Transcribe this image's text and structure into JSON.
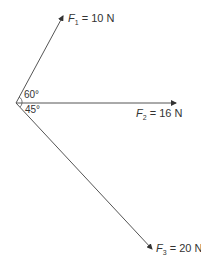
{
  "diagram": {
    "type": "force-vectors",
    "forces": [
      {
        "name": "F",
        "sub": "1",
        "value": "= 10 N"
      },
      {
        "name": "F",
        "sub": "2",
        "value": "= 16 N"
      },
      {
        "name": "F",
        "sub": "3",
        "value": "= 20 N"
      }
    ],
    "angles": [
      "60°",
      "45°"
    ],
    "colors": {
      "line": "#444444",
      "text": "#333333"
    }
  }
}
